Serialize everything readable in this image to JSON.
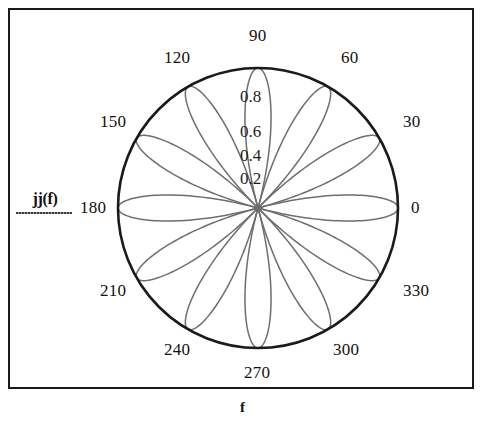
{
  "axis_labels": {
    "y": "jj(f)",
    "x": "f"
  },
  "chart_data": {
    "type": "line",
    "plot_style": "polar",
    "title": "",
    "subtitle": "",
    "xlabel": "f",
    "ylabel": "jj(f)",
    "grid": false,
    "legend": null,
    "legend_position": "none",
    "angle_unit": "degrees",
    "theta_range": [
      0,
      360
    ],
    "theta_tick_interval": 30,
    "theta_ticks": [
      "0",
      "30",
      "60",
      "90",
      "120",
      "150",
      "180",
      "210",
      "240",
      "270",
      "300",
      "330"
    ],
    "radial_ticks": [
      "0.2",
      "0.4",
      "0.6",
      "0.8"
    ],
    "radial_tick_values": [
      0.2,
      0.4,
      0.6,
      0.8
    ],
    "rlim": [
      0,
      1
    ],
    "outer_boundary_r": 1.0,
    "petal_count": 12,
    "petal_peak_r": 1.0,
    "series": [
      {
        "name": "jj(f)",
        "color": "#6e6e6e",
        "description": "12-petal polar rose, |cos(6f)| form, peaks at r = 1.0 on every 30 degree spoke",
        "points": [
          {
            "theta": 0,
            "r": 1.0
          },
          {
            "theta": 15,
            "r": 0.0
          },
          {
            "theta": 30,
            "r": 1.0
          },
          {
            "theta": 45,
            "r": 0.0
          },
          {
            "theta": 60,
            "r": 1.0
          },
          {
            "theta": 75,
            "r": 0.0
          },
          {
            "theta": 90,
            "r": 1.0
          },
          {
            "theta": 105,
            "r": 0.0
          },
          {
            "theta": 120,
            "r": 1.0
          },
          {
            "theta": 135,
            "r": 0.0
          },
          {
            "theta": 150,
            "r": 1.0
          },
          {
            "theta": 165,
            "r": 0.0
          },
          {
            "theta": 180,
            "r": 1.0
          },
          {
            "theta": 195,
            "r": 0.0
          },
          {
            "theta": 210,
            "r": 1.0
          },
          {
            "theta": 225,
            "r": 0.0
          },
          {
            "theta": 240,
            "r": 1.0
          },
          {
            "theta": 255,
            "r": 0.0
          },
          {
            "theta": 270,
            "r": 1.0
          },
          {
            "theta": 285,
            "r": 0.0
          },
          {
            "theta": 300,
            "r": 1.0
          },
          {
            "theta": 315,
            "r": 0.0
          },
          {
            "theta": 330,
            "r": 1.0
          },
          {
            "theta": 345,
            "r": 0.0
          }
        ]
      }
    ]
  },
  "colors": {
    "frame": "#1a1a1a",
    "boundary_circle": "#1a1a1a",
    "curve": "#6e6e6e",
    "text": "#111111",
    "background": "#ffffff"
  },
  "geometry": {
    "center_x": 258,
    "center_y": 208,
    "radius": 140
  }
}
